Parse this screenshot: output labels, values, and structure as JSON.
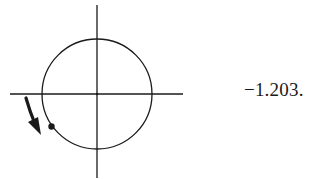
{
  "figure": {
    "type": "unit-circle-diagram",
    "value_label": "−1.203.",
    "axes": {
      "horizontal": {
        "x1": 10,
        "x2": 183,
        "y": 94
      },
      "vertical": {
        "x": 97,
        "y1": 5,
        "y2": 178
      }
    },
    "circle": {
      "cx": 97,
      "cy": 94,
      "r": 55
    },
    "point": {
      "cx": 51,
      "cy": 127,
      "r": 3.2
    },
    "arrow": {
      "direction": "clockwise",
      "from": [
        26,
        98
      ],
      "to": [
        40,
        135
      ]
    },
    "colors": {
      "stroke": "#1a1a1a",
      "background": "#ffffff"
    }
  }
}
